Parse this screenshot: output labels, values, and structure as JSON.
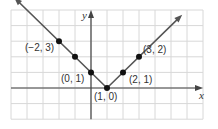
{
  "chart_data": {
    "type": "line",
    "title": "",
    "xlabel": "x",
    "ylabel": "y",
    "function": "y = |x - 1|",
    "xlim": [
      -5,
      7
    ],
    "ylim": [
      -2,
      5
    ],
    "grid": true,
    "points": [
      {
        "x": -2,
        "y": 3,
        "label": "(−2, 3)"
      },
      {
        "x": -1,
        "y": 2,
        "label": ""
      },
      {
        "x": 0,
        "y": 1,
        "label": "(0, 1)"
      },
      {
        "x": 1,
        "y": 0,
        "label": "(1, 0)"
      },
      {
        "x": 2,
        "y": 1,
        "label": "(2, 1)"
      },
      {
        "x": 3,
        "y": 2,
        "label": "(3, 2)"
      }
    ],
    "colors": {
      "line": "#555555",
      "grid": "#d8d8d8",
      "axis": "#444444",
      "point": "#111111"
    }
  }
}
